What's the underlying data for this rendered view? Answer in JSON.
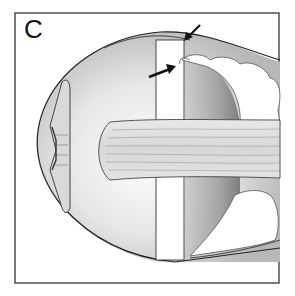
{
  "figure": {
    "panel_label": "C",
    "elements": {
      "eye_outline": "globe-outline",
      "lens": "lens-with-iris",
      "optic_nerve": "horizontal-striated-band",
      "graft_strip": "vertical-white-strip",
      "tissue_clusters": "cloud-like-tissue",
      "arrows": [
        "upper-arrow",
        "lower-arrow"
      ]
    },
    "colors": {
      "line": "#222222",
      "shade_light": "#d6d6d6",
      "shade_mid": "#a8a8a8",
      "shade_dark": "#7a7a7a",
      "background": "#ffffff"
    }
  }
}
